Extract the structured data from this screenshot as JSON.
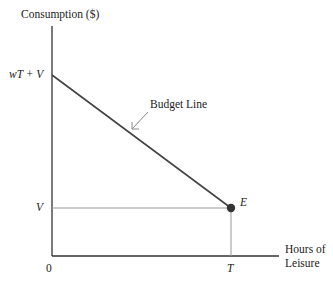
{
  "diagram": {
    "type": "budget-constraint",
    "y_axis_label": "Consumption ($)",
    "x_axis_label_line1": "Hours of",
    "x_axis_label_line2": "Leisure",
    "origin_label": "0",
    "y_tick_top": "wT + V",
    "y_tick_low": "V",
    "x_tick": "T",
    "point_label": "E",
    "callout_label": "Budget Line",
    "colors": {
      "axis": "#333333",
      "budget_line": "#444444",
      "guide_line": "#999999",
      "point": "#333333",
      "arrow": "#888888"
    }
  }
}
